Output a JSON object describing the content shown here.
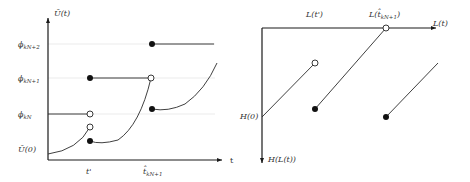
{
  "left_diagram": {
    "y_axis_label": "Ū(t)",
    "x_axis_label": "t",
    "y_ticks": [
      {
        "label": "ϕ",
        "sub": "kN+2"
      },
      {
        "label": "ϕ",
        "sub": "kN+1"
      },
      {
        "label": "ϕ",
        "sub": "kN"
      },
      {
        "label": "Ū(0)",
        "sub": ""
      }
    ],
    "x_ticks": [
      {
        "label": "t'",
        "sub": ""
      },
      {
        "label": "t̂",
        "sub": "kN+1"
      }
    ]
  },
  "right_diagram": {
    "x_axis_label": "L(t)",
    "y_axis_label": "H(L(t))",
    "origin_label": "H(0)",
    "top_labels": [
      {
        "label": "L(t')",
        "sub": ""
      },
      {
        "label": "L(t̂",
        "sub": "kN+1",
        "close": ")"
      }
    ]
  },
  "colors": {
    "line": "#2a2a2a",
    "axis": "#1a1a1a",
    "background": "#ffffff"
  }
}
